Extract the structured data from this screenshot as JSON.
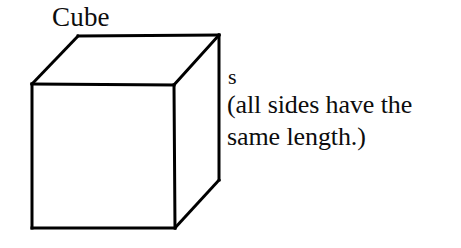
{
  "figure": {
    "kind": "geometry-diagram",
    "subject": "cube",
    "title": "Cube",
    "background_color": "#ffffff",
    "stroke_color": "#000000",
    "stroke_width": 3
  },
  "labels": {
    "title": "Cube",
    "side_label": "s",
    "note_line_1": "(all sides have the",
    "note_line_2": "same length.)"
  },
  "geometry": {
    "front_face": {
      "name": "front-face",
      "points": "32,84 174,85 175,228 32,228"
    },
    "top_face": {
      "name": "top-face",
      "points": "32,84 78,36 219,35 174,85"
    },
    "right_face": {
      "name": "right-face",
      "points": "174,85 219,35 219,180 175,228"
    },
    "edges": [
      {
        "name": "front-top-edge",
        "x1": 32,
        "y1": 84,
        "x2": 174,
        "y2": 85
      },
      {
        "name": "front-right-edge",
        "x1": 174,
        "y1": 85,
        "x2": 175,
        "y2": 228
      },
      {
        "name": "front-bottom-edge",
        "x1": 175,
        "y1": 228,
        "x2": 32,
        "y2": 228
      },
      {
        "name": "front-left-edge",
        "x1": 32,
        "y1": 228,
        "x2": 32,
        "y2": 84
      },
      {
        "name": "top-left-diagonal",
        "x1": 32,
        "y1": 84,
        "x2": 78,
        "y2": 36
      },
      {
        "name": "top-back-edge",
        "x1": 78,
        "y1": 36,
        "x2": 219,
        "y2": 35
      },
      {
        "name": "top-right-diagonal",
        "x1": 219,
        "y1": 35,
        "x2": 174,
        "y2": 85
      },
      {
        "name": "back-right-vertical-edge",
        "x1": 219,
        "y1": 35,
        "x2": 219,
        "y2": 180
      },
      {
        "name": "bottom-right-diagonal",
        "x1": 219,
        "y1": 180,
        "x2": 175,
        "y2": 228
      }
    ]
  }
}
